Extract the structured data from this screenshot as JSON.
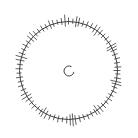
{
  "diagram": {
    "type": "radial-tick-dial",
    "background": "#ffffff",
    "stroke_color": "#2a2a2a",
    "tick_color": "#3a3a3a",
    "outer_ring": {
      "cx": 68.5,
      "cy": 70.5,
      "r": 49
    },
    "center_mark": {
      "cx": 69,
      "cy": 71,
      "r": 5,
      "gap_start_deg": -60,
      "gap_end_deg": 10
    },
    "ticks": [
      {
        "a": 0,
        "i": 3,
        "o": 4
      },
      {
        "a": 5,
        "i": 2,
        "o": 3
      },
      {
        "a": 9,
        "i": 5,
        "o": 6
      },
      {
        "a": 12,
        "i": 4,
        "o": 5
      },
      {
        "a": 17,
        "i": 3,
        "o": 3
      },
      {
        "a": 22,
        "i": 3,
        "o": 4
      },
      {
        "a": 27,
        "i": 2,
        "o": 4
      },
      {
        "a": 32,
        "i": 4,
        "o": 5
      },
      {
        "a": 36,
        "i": 6,
        "o": 5
      },
      {
        "a": 40,
        "i": 3,
        "o": 4
      },
      {
        "a": 45,
        "i": 3,
        "o": 3
      },
      {
        "a": 50,
        "i": 2,
        "o": 4
      },
      {
        "a": 55,
        "i": 3,
        "o": 3
      },
      {
        "a": 60,
        "i": 5,
        "o": 6
      },
      {
        "a": 63,
        "i": 6,
        "o": 5
      },
      {
        "a": 66,
        "i": 3,
        "o": 4
      },
      {
        "a": 71,
        "i": 3,
        "o": 3
      },
      {
        "a": 76,
        "i": 2,
        "o": 4
      },
      {
        "a": 81,
        "i": 3,
        "o": 3
      },
      {
        "a": 86,
        "i": 3,
        "o": 4
      },
      {
        "a": 90,
        "i": 4,
        "o": 3
      },
      {
        "a": 94,
        "i": 2,
        "o": 3
      },
      {
        "a": 99,
        "i": 3,
        "o": 4
      },
      {
        "a": 103,
        "i": 6,
        "o": 5
      },
      {
        "a": 106,
        "i": 4,
        "o": 6
      },
      {
        "a": 110,
        "i": 3,
        "o": 3
      },
      {
        "a": 115,
        "i": 2,
        "o": 4
      },
      {
        "a": 120,
        "i": 3,
        "o": 3
      },
      {
        "a": 125,
        "i": 3,
        "o": 4
      },
      {
        "a": 130,
        "i": 2,
        "o": 3
      },
      {
        "a": 135,
        "i": 3,
        "o": 4
      },
      {
        "a": 140,
        "i": 4,
        "o": 5
      },
      {
        "a": 144,
        "i": 6,
        "o": 5
      },
      {
        "a": 147,
        "i": 3,
        "o": 4
      },
      {
        "a": 152,
        "i": 3,
        "o": 3
      },
      {
        "a": 157,
        "i": 2,
        "o": 4
      },
      {
        "a": 162,
        "i": 3,
        "o": 3
      },
      {
        "a": 167,
        "i": 3,
        "o": 4
      },
      {
        "a": 172,
        "i": 4,
        "o": 6
      },
      {
        "a": 175,
        "i": 6,
        "o": 7
      },
      {
        "a": 178,
        "i": 5,
        "o": 6
      },
      {
        "a": 182,
        "i": 3,
        "o": 4
      },
      {
        "a": 187,
        "i": 2,
        "o": 3
      },
      {
        "a": 192,
        "i": 3,
        "o": 4
      },
      {
        "a": 197,
        "i": 3,
        "o": 3
      },
      {
        "a": 202,
        "i": 2,
        "o": 4
      },
      {
        "a": 207,
        "i": 4,
        "o": 5
      },
      {
        "a": 211,
        "i": 6,
        "o": 5
      },
      {
        "a": 214,
        "i": 3,
        "o": 4
      },
      {
        "a": 219,
        "i": 3,
        "o": 3
      },
      {
        "a": 224,
        "i": 2,
        "o": 4
      },
      {
        "a": 229,
        "i": 3,
        "o": 3
      },
      {
        "a": 234,
        "i": 4,
        "o": 4
      },
      {
        "a": 238,
        "i": 5,
        "o": 6
      },
      {
        "a": 242,
        "i": 3,
        "o": 5
      },
      {
        "a": 247,
        "i": 3,
        "o": 3
      },
      {
        "a": 252,
        "i": 2,
        "o": 4
      },
      {
        "a": 257,
        "i": 3,
        "o": 3
      },
      {
        "a": 262,
        "i": 3,
        "o": 4
      },
      {
        "a": 267,
        "i": 2,
        "o": 3
      },
      {
        "a": 272,
        "i": 3,
        "o": 4
      },
      {
        "a": 277,
        "i": 3,
        "o": 3
      },
      {
        "a": 282,
        "i": 4,
        "o": 5
      },
      {
        "a": 286,
        "i": 6,
        "o": 6
      },
      {
        "a": 290,
        "i": 3,
        "o": 4
      },
      {
        "a": 295,
        "i": 2,
        "o": 3
      },
      {
        "a": 300,
        "i": 3,
        "o": 4
      },
      {
        "a": 305,
        "i": 3,
        "o": 3
      },
      {
        "a": 310,
        "i": 4,
        "o": 5
      },
      {
        "a": 314,
        "i": 5,
        "o": 6
      },
      {
        "a": 318,
        "i": 3,
        "o": 4
      },
      {
        "a": 323,
        "i": 2,
        "o": 3
      },
      {
        "a": 328,
        "i": 3,
        "o": 4
      },
      {
        "a": 333,
        "i": 3,
        "o": 3
      },
      {
        "a": 338,
        "i": 4,
        "o": 5
      },
      {
        "a": 342,
        "i": 3,
        "o": 4
      },
      {
        "a": 347,
        "i": 2,
        "o": 3
      },
      {
        "a": 352,
        "i": 3,
        "o": 4
      },
      {
        "a": 356,
        "i": 5,
        "o": 7
      }
    ]
  }
}
